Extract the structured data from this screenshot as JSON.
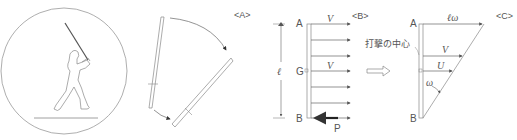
{
  "panels": {
    "a": {
      "label": "<A>",
      "description": "Batter swinging; bat rotates from vertical to diagonal"
    },
    "b": {
      "label": "<B>",
      "top_point": "A",
      "center_point": "G",
      "bottom_point": "B",
      "length_label": "ℓ",
      "velocity_top": "V",
      "velocity_center": "V",
      "force_label": "P",
      "arrow_count": 7
    },
    "c": {
      "label": "<C>",
      "top_point": "A",
      "bottom_point": "B",
      "top_velocity": "ℓω",
      "center_of_percussion_velocity": "V",
      "center_velocity": "U",
      "angular_velocity": "ω",
      "center_of_percussion_label": "打撃の中心"
    }
  },
  "colors": {
    "line": "#888888",
    "text": "#555555",
    "arrow_fill": "#333333"
  }
}
